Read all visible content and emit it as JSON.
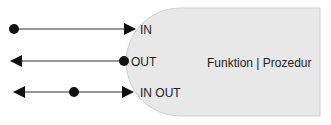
{
  "diagram": {
    "block": {
      "title": "Funktion | Prozedur",
      "fill": "#e8e8e8",
      "stroke": "#cfcfcf"
    },
    "parameters": [
      {
        "label": "IN",
        "direction": "in"
      },
      {
        "label": "OUT",
        "direction": "out"
      },
      {
        "label": "IN OUT",
        "direction": "inout"
      }
    ],
    "colors": {
      "line": "#333333",
      "marker": "#111111"
    }
  }
}
